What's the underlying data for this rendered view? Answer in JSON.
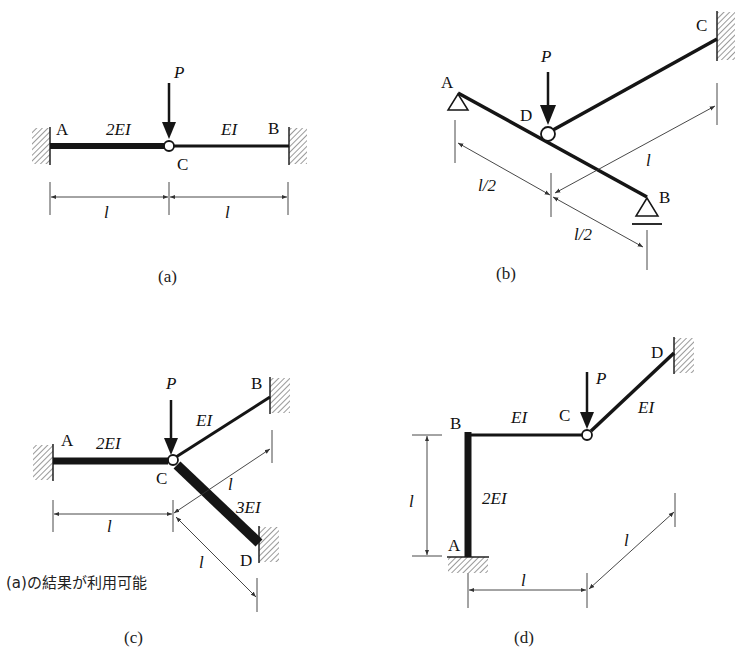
{
  "figures": {
    "a": {
      "caption": "(a)",
      "load_label": "P",
      "nodes": {
        "A": "A",
        "B": "B",
        "C": "C"
      },
      "members": [
        {
          "from": "A",
          "to": "C",
          "stiffness": "2EI"
        },
        {
          "from": "C",
          "to": "B",
          "stiffness": "EI"
        }
      ],
      "dimensions": [
        "l",
        "l"
      ],
      "supports": {
        "A": "fixed",
        "B": "fixed"
      },
      "hinge": "C"
    },
    "b": {
      "caption": "(b)",
      "load_label": "P",
      "nodes": {
        "A": "A",
        "B": "B",
        "C": "C",
        "D": "D"
      },
      "members": [
        {
          "from": "A",
          "to": "B"
        },
        {
          "from": "D",
          "to": "C"
        }
      ],
      "dimensions": [
        "l/2",
        "l/2",
        "l"
      ],
      "supports": {
        "A": "pin",
        "B": "roller",
        "C": "fixed"
      },
      "hinge": "D"
    },
    "c": {
      "caption": "(c)",
      "load_label": "P",
      "nodes": {
        "A": "A",
        "B": "B",
        "C": "C",
        "D": "D"
      },
      "members": [
        {
          "from": "A",
          "to": "C",
          "stiffness": "2EI"
        },
        {
          "from": "C",
          "to": "B",
          "stiffness": "EI"
        },
        {
          "from": "C",
          "to": "D",
          "stiffness": "3EI"
        }
      ],
      "dimensions": [
        "l",
        "l",
        "l"
      ],
      "supports": {
        "A": "fixed",
        "B": "fixed",
        "D": "fixed"
      },
      "hinge": "C",
      "note": "(a)の結果が利用可能"
    },
    "d": {
      "caption": "(d)",
      "load_label": "P",
      "nodes": {
        "A": "A",
        "B": "B",
        "C": "C",
        "D": "D"
      },
      "members": [
        {
          "from": "A",
          "to": "B",
          "stiffness": "2EI"
        },
        {
          "from": "B",
          "to": "C",
          "stiffness": "EI"
        },
        {
          "from": "C",
          "to": "D",
          "stiffness": "EI"
        }
      ],
      "dimensions": [
        "l",
        "l",
        "l"
      ],
      "supports": {
        "A": "fixed",
        "D": "fixed"
      },
      "hinge": "C"
    }
  }
}
